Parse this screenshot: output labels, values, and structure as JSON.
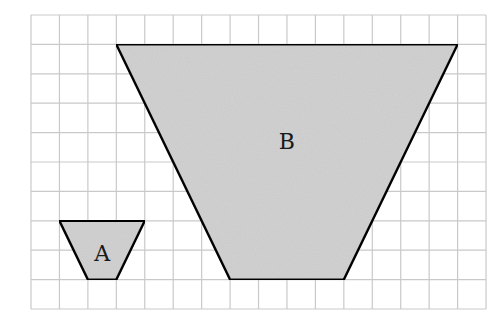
{
  "diagram": {
    "type": "grid-with-trapezoids",
    "grid": {
      "columns": 16,
      "rows": 10,
      "origin_px": [
        31,
        15
      ],
      "cell_w_px": 28.44,
      "cell_h_px": 29.4,
      "line_color": "#c9c9c9"
    },
    "fill_color": "#d3d3d3",
    "stroke_color": "#111111",
    "shapes": [
      {
        "id": "A",
        "label": "A",
        "kind": "trapezoid",
        "vertices_grid": [
          [
            1,
            7
          ],
          [
            4,
            7
          ],
          [
            3,
            9
          ],
          [
            2,
            9
          ]
        ],
        "label_grid": [
          2.5,
          8.1
        ],
        "top_width_units": 3,
        "bottom_width_units": 1,
        "height_units": 2
      },
      {
        "id": "B",
        "label": "B",
        "kind": "trapezoid",
        "vertices_grid": [
          [
            3,
            1
          ],
          [
            15,
            1
          ],
          [
            11,
            9
          ],
          [
            7,
            9
          ]
        ],
        "label_grid": [
          9,
          4.3
        ],
        "top_width_units": 12,
        "bottom_width_units": 4,
        "height_units": 8
      }
    ]
  }
}
